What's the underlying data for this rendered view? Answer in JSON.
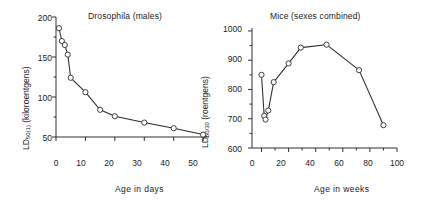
{
  "figure": {
    "background": "#ffffff",
    "line_color": "#2a2a2a",
    "marker_fill": "#ffffff"
  },
  "panels": {
    "left": {
      "title_italic": "Drosophila",
      "title_rest": " (males)",
      "y_axis_label_prefix": "LD",
      "y_axis_label_subscript": "50(1)",
      "y_axis_label_suffix": " (kiloroentgens)",
      "x_axis_label": "Age in days",
      "y_ticks": [
        "200",
        "150",
        "100",
        "50"
      ],
      "x_ticks": [
        "0",
        "10",
        "20",
        "30",
        "40",
        "50"
      ]
    },
    "right": {
      "title": "Mice (sexes combined)",
      "y_axis_label_prefix": "LD",
      "y_axis_label_subscript": "50/30",
      "y_axis_label_suffix": " (roentgens)",
      "x_axis_label": "Age in weeks",
      "y_ticks": [
        "1000",
        "900",
        "800",
        "700",
        "600"
      ],
      "x_ticks": [
        "0",
        "20",
        "40",
        "60",
        "80",
        "100"
      ]
    }
  },
  "chart_data": [
    {
      "type": "line",
      "title": "Drosophila (males)",
      "xlabel": "Age in days",
      "ylabel": "LD50(1) (kiloroentgens)",
      "xlim": [
        0,
        52
      ],
      "ylim": [
        50,
        200
      ],
      "xticks": [
        0,
        10,
        20,
        30,
        40,
        50
      ],
      "yticks": [
        50,
        100,
        150,
        200
      ],
      "grid": false,
      "legend": "none",
      "markers": "open-circle",
      "x": [
        1,
        2,
        3,
        4,
        5,
        10,
        15,
        20,
        30,
        40,
        50
      ],
      "y": [
        186,
        170,
        165,
        153,
        124,
        106,
        84,
        76,
        68,
        61,
        53
      ]
    },
    {
      "type": "line",
      "title": "Mice (sexes combined)",
      "xlabel": "Age in weeks",
      "ylabel": "LD50/30 (roentgens)",
      "xlim": [
        -7,
        100
      ],
      "ylim": [
        600,
        1010
      ],
      "xticks": [
        0,
        20,
        40,
        60,
        80,
        100
      ],
      "yticks": [
        600,
        700,
        800,
        900,
        1000
      ],
      "xminorticks": [
        10,
        30,
        50,
        70,
        90
      ],
      "grid": false,
      "legend": "none",
      "markers": "open-circle",
      "x": [
        0,
        2,
        3,
        5,
        9,
        20,
        29,
        48,
        72,
        90
      ],
      "y": [
        850,
        710,
        697,
        728,
        825,
        889,
        943,
        953,
        866,
        678
      ]
    }
  ]
}
